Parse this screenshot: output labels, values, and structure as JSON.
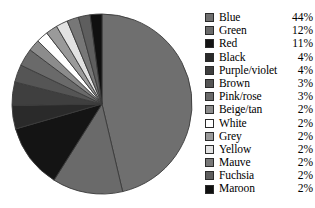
{
  "chart_data": {
    "type": "pie",
    "title": "",
    "subtitle": "",
    "xlabel": "",
    "ylabel": "",
    "grid": false,
    "legend_position": "right",
    "start_angle_deg": 0,
    "direction": "clockwise",
    "categories": [
      "Blue",
      "Green",
      "Red",
      "Black",
      "Purple/violet",
      "Brown",
      "Pink/rose",
      "Beige/tan",
      "White",
      "Grey",
      "Yellow",
      "Mauve",
      "Fuchsia",
      "Maroon"
    ],
    "values": [
      44,
      12,
      11,
      4,
      4,
      3,
      3,
      2,
      2,
      2,
      2,
      2,
      2,
      2
    ],
    "value_labels": [
      "44%",
      "12%",
      "11%",
      "4%",
      "4%",
      "3%",
      "3%",
      "2%",
      "2%",
      "2%",
      "2%",
      "2%",
      "2%",
      "2%"
    ],
    "unit": "%",
    "slice_colors": [
      "#6f6f6f",
      "#6a6a6a",
      "#141414",
      "#2a2a2a",
      "#3f3f3f",
      "#555555",
      "#6a6a6a",
      "#8c8c8c",
      "#ffffff",
      "#9a9a9a",
      "#e2e2e2",
      "#777777",
      "#5e5e5e",
      "#101010"
    ],
    "outline_color": "#3a3a3a"
  },
  "legend": {
    "rows": [
      {
        "label": "Blue",
        "value": "44%",
        "swatch": "#6f6f6f"
      },
      {
        "label": "Green",
        "value": "12%",
        "swatch": "#6a6a6a"
      },
      {
        "label": "Red",
        "value": "11%",
        "swatch": "#141414"
      },
      {
        "label": "Black",
        "value": "4%",
        "swatch": "#2a2a2a"
      },
      {
        "label": "Purple/violet",
        "value": "4%",
        "swatch": "#3f3f3f"
      },
      {
        "label": "Brown",
        "value": "3%",
        "swatch": "#555555"
      },
      {
        "label": "Pink/rose",
        "value": "3%",
        "swatch": "#6a6a6a"
      },
      {
        "label": "Beige/tan",
        "value": "2%",
        "swatch": "#8c8c8c"
      },
      {
        "label": "White",
        "value": "2%",
        "swatch": "#ffffff"
      },
      {
        "label": "Grey",
        "value": "2%",
        "swatch": "#9a9a9a"
      },
      {
        "label": "Yellow",
        "value": "2%",
        "swatch": "#e2e2e2"
      },
      {
        "label": "Mauve",
        "value": "2%",
        "swatch": "#777777"
      },
      {
        "label": "Fuchsia",
        "value": "2%",
        "swatch": "#5e5e5e"
      },
      {
        "label": "Maroon",
        "value": "2%",
        "swatch": "#101010"
      }
    ]
  },
  "geometry": {
    "center_x": 102,
    "center_y": 104,
    "radius": 90
  }
}
